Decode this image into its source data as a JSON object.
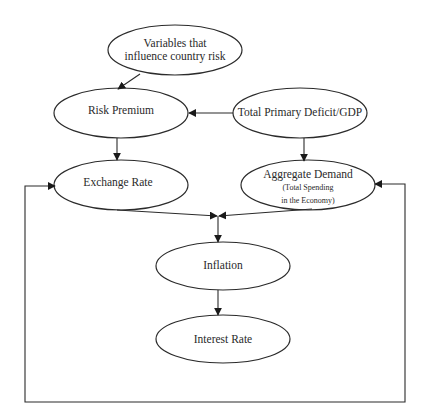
{
  "diagram": {
    "title": "",
    "colors": {
      "stroke": "#2b2b2b",
      "text": "#2a2a2a",
      "background": "#ffffff"
    },
    "nodes": [
      {
        "id": "variables",
        "label_line1": "Variables that",
        "label_line2": "influence country risk",
        "cx": 175,
        "cy": 50,
        "rx": 67,
        "ry": 25
      },
      {
        "id": "risk_premium",
        "label": "Risk Premium",
        "cx": 121,
        "cy": 113,
        "rx": 67,
        "ry": 25
      },
      {
        "id": "deficit",
        "label": "Total Primary Deficit/GDP",
        "cx": 300,
        "cy": 113,
        "rx": 67,
        "ry": 25
      },
      {
        "id": "exchange_rate",
        "label": "Exchange Rate",
        "cx": 121,
        "cy": 185,
        "rx": 67,
        "ry": 25
      },
      {
        "id": "aggregate_demand",
        "label": "Aggregate Demand",
        "sublabel_line1": "(Total Spending",
        "sublabel_line2": "in the Economy)",
        "cx": 308,
        "cy": 185,
        "rx": 67,
        "ry": 25
      },
      {
        "id": "inflation",
        "label": "Inflation",
        "cx": 223,
        "cy": 266,
        "rx": 67,
        "ry": 24
      },
      {
        "id": "interest_rate",
        "label": "Interest Rate",
        "cx": 223,
        "cy": 339,
        "rx": 67,
        "ry": 24
      }
    ],
    "edges": [
      {
        "from": "variables",
        "to": "risk_premium"
      },
      {
        "from": "deficit",
        "to": "risk_premium"
      },
      {
        "from": "risk_premium",
        "to": "exchange_rate"
      },
      {
        "from": "deficit",
        "to": "aggregate_demand"
      },
      {
        "from": "exchange_rate",
        "to": "inflation"
      },
      {
        "from": "aggregate_demand",
        "to": "inflation"
      },
      {
        "from": "inflation",
        "to": "interest_rate"
      },
      {
        "from": "interest_rate",
        "to": "exchange_rate",
        "type": "feedback-left"
      },
      {
        "from": "interest_rate",
        "to": "aggregate_demand",
        "type": "feedback-right"
      }
    ]
  }
}
